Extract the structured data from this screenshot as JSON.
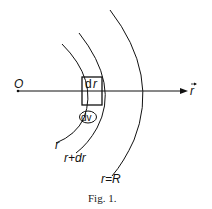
{
  "diagram": {
    "origin_label": "O",
    "axis_label": "r",
    "box_label_d": "d",
    "box_label_r": "r",
    "volume_label": "dv",
    "shell_labels": {
      "inner": "r",
      "middle": "r+dr",
      "outer": "r=R"
    }
  },
  "caption": "Fig. 1.",
  "colors": {
    "stroke": "#111111",
    "background": "#ffffff"
  }
}
